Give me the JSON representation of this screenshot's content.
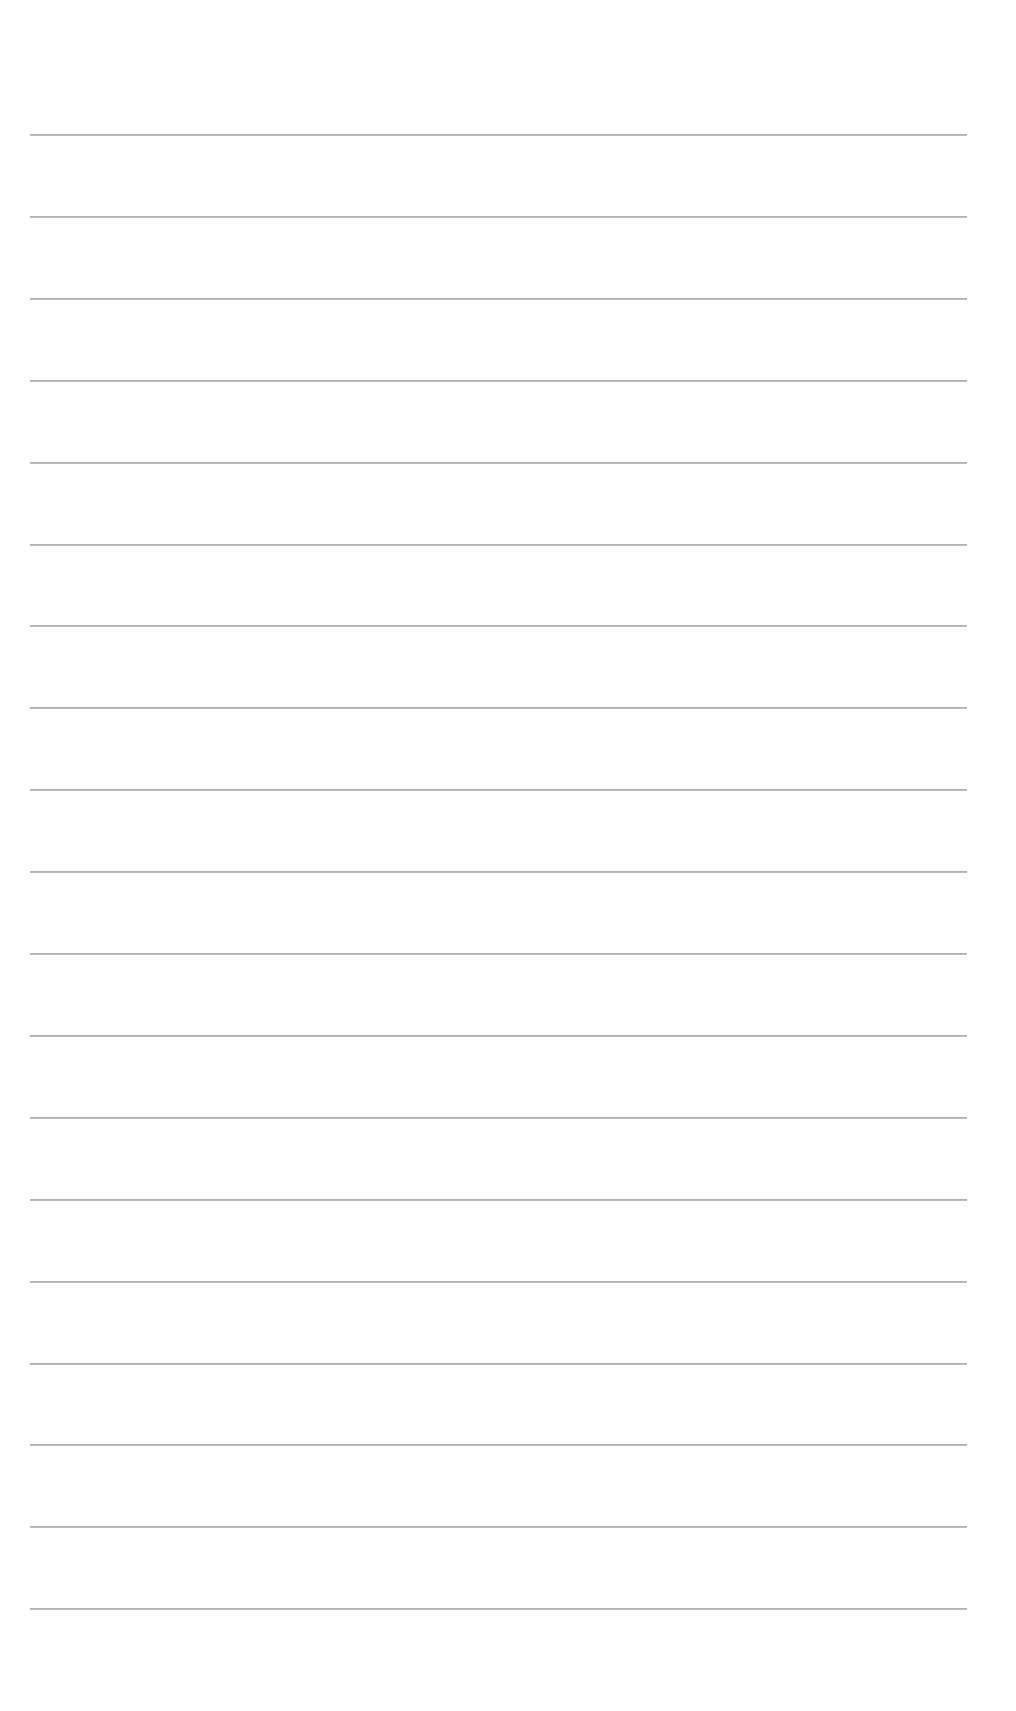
{
  "document": {
    "type": "lined-paper",
    "background_color": "#fefefe",
    "rule_color": "#a0a0a0",
    "rule_count": 19,
    "rule_left_px": 30,
    "rule_right_px": 967,
    "first_rule_y_px": 134,
    "rule_spacing_px": 81.9,
    "content_text": ""
  }
}
